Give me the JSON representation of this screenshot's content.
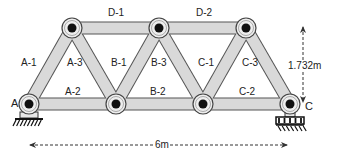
{
  "diagram": {
    "type": "truss",
    "colors": {
      "member_fill": "#d9d9d9",
      "member_stroke": "#555555",
      "joint_outer": "#eeeeee",
      "joint_pin": "#111111",
      "dimension_line": "#333333"
    },
    "joints": [
      {
        "id": "A",
        "x": 29,
        "y": 104,
        "label": "A"
      },
      {
        "id": "B1",
        "x": 116,
        "y": 104,
        "label": ""
      },
      {
        "id": "B2",
        "x": 203,
        "y": 104,
        "label": ""
      },
      {
        "id": "C",
        "x": 290,
        "y": 104,
        "label": "C"
      },
      {
        "id": "T1",
        "x": 72,
        "y": 28,
        "label": ""
      },
      {
        "id": "T2",
        "x": 159,
        "y": 28,
        "label": ""
      },
      {
        "id": "T3",
        "x": 246,
        "y": 28,
        "label": ""
      }
    ],
    "members": [
      {
        "id": "A-1",
        "label": "A-1",
        "from": "A",
        "to": "T1",
        "label_x": 30,
        "label_y": 64
      },
      {
        "id": "A-2",
        "label": "A-2",
        "from": "A",
        "to": "B1",
        "label_x": 74,
        "label_y": 93
      },
      {
        "id": "A-3",
        "label": "A-3",
        "from": "T1",
        "to": "B1",
        "label_x": 76,
        "label_y": 64
      },
      {
        "id": "B-1",
        "label": "B-1",
        "from": "B1",
        "to": "T2",
        "label_x": 120,
        "label_y": 64
      },
      {
        "id": "B-2",
        "label": "B-2",
        "from": "B1",
        "to": "B2",
        "label_x": 159,
        "label_y": 93
      },
      {
        "id": "B-3",
        "label": "B-3",
        "from": "T2",
        "to": "B2",
        "label_x": 160,
        "label_y": 64
      },
      {
        "id": "C-1",
        "label": "C-1",
        "from": "B2",
        "to": "T3",
        "label_x": 207,
        "label_y": 64
      },
      {
        "id": "C-2",
        "label": "C-2",
        "from": "B2",
        "to": "C",
        "label_x": 248,
        "label_y": 93
      },
      {
        "id": "C-3",
        "label": "C-3",
        "from": "T3",
        "to": "C",
        "label_x": 251,
        "label_y": 64
      },
      {
        "id": "D-1",
        "label": "D-1",
        "from": "T1",
        "to": "T2",
        "label_x": 117,
        "label_y": 14
      },
      {
        "id": "D-2",
        "label": "D-2",
        "from": "T2",
        "to": "T3",
        "label_x": 205,
        "label_y": 14
      }
    ],
    "supports": [
      {
        "joint": "A",
        "type": "pin"
      },
      {
        "joint": "C",
        "type": "roller"
      }
    ],
    "dimensions": [
      {
        "id": "span",
        "label": "6m",
        "orientation": "horizontal",
        "x1": 30,
        "x2": 287,
        "y": 145
      },
      {
        "id": "height",
        "label": "1.732m",
        "orientation": "vertical",
        "x": 303,
        "y1": 27,
        "y2": 102
      }
    ],
    "labels": {
      "joint_a": "A",
      "joint_c": "C",
      "span": "6m",
      "height": "1.732m"
    }
  }
}
